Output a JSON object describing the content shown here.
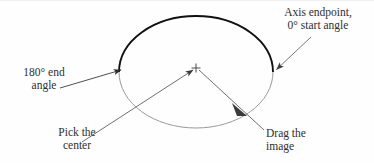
{
  "figure": {
    "background_color": "#fefefe",
    "ink_color": "#2e2e2e",
    "callouts": {
      "axis_endpoint": "Axis endpoint,\n0° start angle",
      "end_angle": "180° end\nangle",
      "pick_center": "Pick the\ncenter",
      "drag_image": "Drag the\nimage"
    },
    "shapes": {
      "ellipse": {
        "center_x": 196,
        "center_y": 72,
        "radius_x": 77,
        "radius_y": 56,
        "upper_arc_color": "#111111",
        "upper_arc_width": 1.9,
        "lower_arc_color": "#9a9a9a",
        "lower_arc_width": 1.0
      },
      "center_marker": {
        "x": 196,
        "y": 68,
        "kind": "crosshair-plus",
        "color": "#4a4a4a"
      },
      "leaders": [
        {
          "name": "axis-endpoint-leader",
          "from_x": 310,
          "from_y": 38,
          "to_x": 275,
          "to_y": 70,
          "arrow": "end",
          "color": "#6f6f6f"
        },
        {
          "name": "end-angle-leader",
          "from_x": 62,
          "from_y": 88,
          "to_x": 122,
          "to_y": 70,
          "arrow": "end",
          "color": "#4a4a4a"
        },
        {
          "name": "pick-center-leader",
          "from_x": 88,
          "from_y": 138,
          "to_x": 194,
          "to_y": 70,
          "arrow": "end",
          "color": "#6f6f6f"
        },
        {
          "name": "drag-image-leader",
          "from_x": 300,
          "from_y": 134,
          "to_x": 200,
          "to_y": 71,
          "arrow": "start",
          "color": "#6f6f6f"
        }
      ]
    }
  }
}
